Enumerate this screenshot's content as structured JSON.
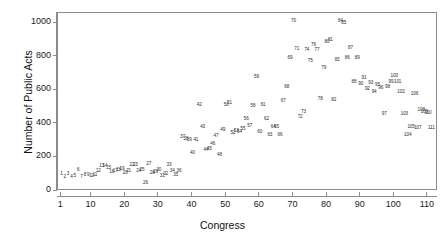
{
  "chart_data": {
    "type": "scatter",
    "title": "",
    "xlabel": "Congress",
    "ylabel": "Number of Public Acts",
    "xlim": [
      0,
      113
    ],
    "ylim": [
      0,
      1060
    ],
    "grid": false,
    "legend": "none",
    "point_marker": "text-label-is-congress-number",
    "xticks": [
      1,
      10,
      20,
      30,
      40,
      50,
      60,
      70,
      80,
      90,
      100,
      110
    ],
    "xtick_labels": [
      "1",
      "10",
      "20",
      "30",
      "40",
      "50",
      "60",
      "70",
      "80",
      "90",
      "100",
      "110"
    ],
    "yticks": [
      0,
      200,
      400,
      600,
      800,
      1000
    ],
    "ytick_labels": [
      "0",
      "200",
      "400",
      "600",
      "800",
      "1000"
    ],
    "points": [
      {
        "label": "1",
        "x": 1,
        "y": 100
      },
      {
        "label": "2",
        "x": 2,
        "y": 82
      },
      {
        "label": "3",
        "x": 3,
        "y": 102
      },
      {
        "label": "4",
        "x": 4,
        "y": 85
      },
      {
        "label": "5",
        "x": 5,
        "y": 90
      },
      {
        "label": "6",
        "x": 6,
        "y": 128
      },
      {
        "label": "7",
        "x": 7,
        "y": 82
      },
      {
        "label": "8",
        "x": 8,
        "y": 96
      },
      {
        "label": "9",
        "x": 9,
        "y": 94
      },
      {
        "label": "10",
        "x": 10,
        "y": 92
      },
      {
        "label": "11",
        "x": 11,
        "y": 95
      },
      {
        "label": "12",
        "x": 12,
        "y": 118
      },
      {
        "label": "13",
        "x": 13,
        "y": 148
      },
      {
        "label": "14",
        "x": 14,
        "y": 150
      },
      {
        "label": "15",
        "x": 15,
        "y": 138
      },
      {
        "label": "16",
        "x": 16,
        "y": 112
      },
      {
        "label": "17",
        "x": 17,
        "y": 118
      },
      {
        "label": "18",
        "x": 18,
        "y": 128
      },
      {
        "label": "19",
        "x": 19,
        "y": 130
      },
      {
        "label": "20",
        "x": 20,
        "y": 110
      },
      {
        "label": "21",
        "x": 21,
        "y": 120
      },
      {
        "label": "22",
        "x": 22,
        "y": 152
      },
      {
        "label": "23",
        "x": 23,
        "y": 156
      },
      {
        "label": "24",
        "x": 24,
        "y": 118
      },
      {
        "label": "25",
        "x": 25,
        "y": 128
      },
      {
        "label": "26",
        "x": 26,
        "y": 46
      },
      {
        "label": "27",
        "x": 27,
        "y": 158
      },
      {
        "label": "28",
        "x": 28,
        "y": 110
      },
      {
        "label": "29",
        "x": 29,
        "y": 116
      },
      {
        "label": "30",
        "x": 30,
        "y": 126
      },
      {
        "label": "31",
        "x": 31,
        "y": 90
      },
      {
        "label": "32",
        "x": 32,
        "y": 104
      },
      {
        "label": "33",
        "x": 33,
        "y": 152
      },
      {
        "label": "34",
        "x": 34,
        "y": 122
      },
      {
        "label": "35",
        "x": 35,
        "y": 96
      },
      {
        "label": "36",
        "x": 36,
        "y": 122
      },
      {
        "label": "37",
        "x": 37,
        "y": 320
      },
      {
        "label": "38",
        "x": 38,
        "y": 310
      },
      {
        "label": "39",
        "x": 39,
        "y": 304
      },
      {
        "label": "40",
        "x": 40,
        "y": 228
      },
      {
        "label": "41",
        "x": 41,
        "y": 306
      },
      {
        "label": "42",
        "x": 42,
        "y": 514
      },
      {
        "label": "43",
        "x": 43,
        "y": 384
      },
      {
        "label": "44",
        "x": 44,
        "y": 244
      },
      {
        "label": "45",
        "x": 45,
        "y": 248
      },
      {
        "label": "46",
        "x": 46,
        "y": 280
      },
      {
        "label": "47",
        "x": 47,
        "y": 326
      },
      {
        "label": "48",
        "x": 48,
        "y": 216
      },
      {
        "label": "49",
        "x": 49,
        "y": 364
      },
      {
        "label": "50",
        "x": 50,
        "y": 510
      },
      {
        "label": "51",
        "x": 51,
        "y": 524
      },
      {
        "label": "52",
        "x": 52,
        "y": 348
      },
      {
        "label": "53",
        "x": 53,
        "y": 360
      },
      {
        "label": "54",
        "x": 54,
        "y": 352
      },
      {
        "label": "55",
        "x": 55,
        "y": 368
      },
      {
        "label": "56",
        "x": 56,
        "y": 428
      },
      {
        "label": "57",
        "x": 57,
        "y": 390
      },
      {
        "label": "58",
        "x": 58,
        "y": 504
      },
      {
        "label": "59",
        "x": 59,
        "y": 680
      },
      {
        "label": "60",
        "x": 60,
        "y": 350
      },
      {
        "label": "61",
        "x": 61,
        "y": 512
      },
      {
        "label": "62",
        "x": 62,
        "y": 430
      },
      {
        "label": "63",
        "x": 63,
        "y": 336
      },
      {
        "label": "64",
        "x": 64,
        "y": 382
      },
      {
        "label": "65",
        "x": 65,
        "y": 382
      },
      {
        "label": "66",
        "x": 66,
        "y": 336
      },
      {
        "label": "67",
        "x": 67,
        "y": 534
      },
      {
        "label": "68",
        "x": 68,
        "y": 622
      },
      {
        "label": "69",
        "x": 69,
        "y": 792
      },
      {
        "label": "70",
        "x": 70,
        "y": 1010
      },
      {
        "label": "71",
        "x": 71,
        "y": 846
      },
      {
        "label": "72",
        "x": 72,
        "y": 442
      },
      {
        "label": "73",
        "x": 73,
        "y": 468
      },
      {
        "label": "74",
        "x": 74,
        "y": 840
      },
      {
        "label": "75",
        "x": 75,
        "y": 776
      },
      {
        "label": "76",
        "x": 76,
        "y": 870
      },
      {
        "label": "77",
        "x": 77,
        "y": 840
      },
      {
        "label": "78",
        "x": 78,
        "y": 546
      },
      {
        "label": "79",
        "x": 79,
        "y": 734
      },
      {
        "label": "80",
        "x": 80,
        "y": 886
      },
      {
        "label": "81",
        "x": 81,
        "y": 902
      },
      {
        "label": "82",
        "x": 82,
        "y": 542
      },
      {
        "label": "83",
        "x": 83,
        "y": 778
      },
      {
        "label": "84",
        "x": 84,
        "y": 1012
      },
      {
        "label": "85",
        "x": 85,
        "y": 1000
      },
      {
        "label": "86",
        "x": 86,
        "y": 790
      },
      {
        "label": "87",
        "x": 87,
        "y": 854
      },
      {
        "label": "88",
        "x": 88,
        "y": 648
      },
      {
        "label": "89",
        "x": 89,
        "y": 792
      },
      {
        "label": "90",
        "x": 90,
        "y": 640
      },
      {
        "label": "91",
        "x": 91,
        "y": 674
      },
      {
        "label": "92",
        "x": 92,
        "y": 606
      },
      {
        "label": "93",
        "x": 93,
        "y": 646
      },
      {
        "label": "94",
        "x": 94,
        "y": 588
      },
      {
        "label": "95",
        "x": 95,
        "y": 632
      },
      {
        "label": "96",
        "x": 96,
        "y": 612
      },
      {
        "label": "97",
        "x": 97,
        "y": 458
      },
      {
        "label": "98",
        "x": 98,
        "y": 622
      },
      {
        "label": "99",
        "x": 99,
        "y": 650
      },
      {
        "label": "100",
        "x": 100,
        "y": 682
      },
      {
        "label": "101",
        "x": 101,
        "y": 650
      },
      {
        "label": "102",
        "x": 102,
        "y": 590
      },
      {
        "label": "103",
        "x": 103,
        "y": 460
      },
      {
        "label": "104",
        "x": 104,
        "y": 336
      },
      {
        "label": "105",
        "x": 105,
        "y": 380
      },
      {
        "label": "106",
        "x": 106,
        "y": 580
      },
      {
        "label": "107",
        "x": 107,
        "y": 376
      },
      {
        "label": "108",
        "x": 108,
        "y": 482
      },
      {
        "label": "109",
        "x": 109,
        "y": 470
      },
      {
        "label": "110",
        "x": 110,
        "y": 462
      },
      {
        "label": "111",
        "x": 111,
        "y": 376
      }
    ]
  }
}
